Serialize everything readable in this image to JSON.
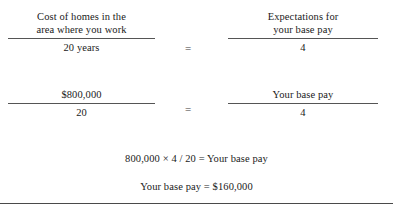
{
  "document": {
    "type": "equation-figure",
    "background_color": "#ffffff",
    "text_color": "#1a1a1a",
    "rule_color": "#555555"
  },
  "equations": [
    {
      "id": "ratio-definition",
      "left": {
        "numerator": "Cost of homes in the\narea where you work",
        "denominator": "20 years"
      },
      "operator": "=",
      "right": {
        "numerator": "Expectations for\nyour base pay",
        "denominator": "4"
      }
    },
    {
      "id": "ratio-with-values",
      "left": {
        "numerator": "$800,000",
        "denominator": "20"
      },
      "operator": "=",
      "right": {
        "numerator": "Your base pay",
        "denominator": "4"
      }
    }
  ],
  "results": [
    {
      "id": "cross-multiply",
      "text": "800,000 × 4 / 20  = Your base pay"
    },
    {
      "id": "final-answer",
      "text": "Your base pay  =  $160,000"
    }
  ]
}
